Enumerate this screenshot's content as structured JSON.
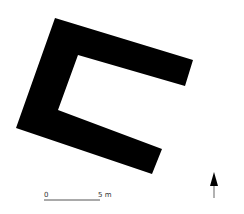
{
  "plan": {
    "fill": "#000000",
    "outline": [
      [
        55,
        18
      ],
      [
        193,
        60
      ],
      [
        186,
        85
      ],
      [
        78,
        55
      ],
      [
        58,
        110
      ],
      [
        162,
        148
      ],
      [
        153,
        173
      ],
      [
        16,
        127
      ]
    ]
  },
  "scale_bar": {
    "start_label": "0",
    "end_label": "5 m",
    "color": "#555555"
  },
  "north_arrow": {
    "head_color": "#000000",
    "tail_color": "#999999"
  }
}
